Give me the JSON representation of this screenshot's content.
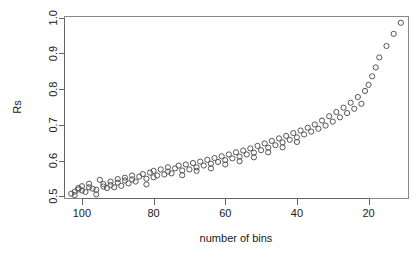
{
  "chart_data": {
    "type": "scatter",
    "title": "",
    "xlabel": "number of bins",
    "ylabel": "Rs",
    "xlim": [
      105,
      9
    ],
    "ylim": [
      0.495,
      1.005
    ],
    "x_reversed": true,
    "grid": false,
    "legend": null,
    "marker": "open-circle",
    "marker_color": "#555555",
    "marker_radius_px": 2.6,
    "xticks": [
      100,
      80,
      60,
      40,
      20
    ],
    "xtick_labels": [
      "100",
      "80",
      "60",
      "40",
      "20"
    ],
    "yticks": [
      0.5,
      0.6,
      0.7,
      0.8,
      0.9,
      1.0
    ],
    "ytick_labels": [
      "0.5",
      "0.6",
      "0.7",
      "0.8",
      "0.9",
      "1.0"
    ],
    "n_points": 112,
    "x": [
      103,
      102,
      102,
      101,
      101,
      100,
      100,
      99,
      98,
      98,
      97,
      96,
      96,
      95,
      94,
      94,
      93,
      92,
      92,
      91,
      90,
      90,
      89,
      88,
      88,
      87,
      86,
      86,
      85,
      84,
      83,
      82,
      82,
      81,
      80,
      80,
      79,
      78,
      77,
      76,
      76,
      75,
      74,
      73,
      72,
      72,
      71,
      70,
      69,
      68,
      68,
      67,
      66,
      65,
      64,
      64,
      63,
      62,
      61,
      60,
      60,
      59,
      58,
      57,
      56,
      56,
      55,
      54,
      53,
      52,
      52,
      51,
      50,
      49,
      48,
      48,
      47,
      46,
      45,
      44,
      44,
      43,
      42,
      41,
      40,
      40,
      39,
      38,
      37,
      36,
      35,
      34,
      33,
      32,
      31,
      30,
      29,
      28,
      27,
      26,
      25,
      24,
      23,
      22,
      21,
      20,
      19,
      18,
      17,
      15,
      13,
      11
    ],
    "y": [
      0.507,
      0.513,
      0.503,
      0.519,
      0.523,
      0.516,
      0.528,
      0.512,
      0.525,
      0.535,
      0.521,
      0.518,
      0.505,
      0.546,
      0.527,
      0.534,
      0.523,
      0.531,
      0.541,
      0.525,
      0.538,
      0.548,
      0.529,
      0.544,
      0.552,
      0.536,
      0.547,
      0.558,
      0.541,
      0.555,
      0.562,
      0.549,
      0.533,
      0.566,
      0.553,
      0.571,
      0.558,
      0.575,
      0.561,
      0.569,
      0.581,
      0.564,
      0.578,
      0.586,
      0.572,
      0.559,
      0.589,
      0.575,
      0.593,
      0.581,
      0.571,
      0.597,
      0.586,
      0.602,
      0.591,
      0.578,
      0.607,
      0.596,
      0.612,
      0.601,
      0.589,
      0.617,
      0.606,
      0.623,
      0.611,
      0.598,
      0.628,
      0.617,
      0.634,
      0.622,
      0.609,
      0.641,
      0.629,
      0.648,
      0.636,
      0.623,
      0.655,
      0.643,
      0.662,
      0.651,
      0.637,
      0.669,
      0.658,
      0.677,
      0.665,
      0.652,
      0.684,
      0.673,
      0.692,
      0.681,
      0.701,
      0.689,
      0.712,
      0.698,
      0.724,
      0.709,
      0.736,
      0.721,
      0.748,
      0.733,
      0.762,
      0.745,
      0.778,
      0.759,
      0.795,
      0.812,
      0.836,
      0.861,
      0.889,
      0.921,
      0.955,
      0.986
    ],
    "plot_area_px": {
      "left": 64,
      "right": 408,
      "top": 16,
      "bottom": 198
    }
  }
}
